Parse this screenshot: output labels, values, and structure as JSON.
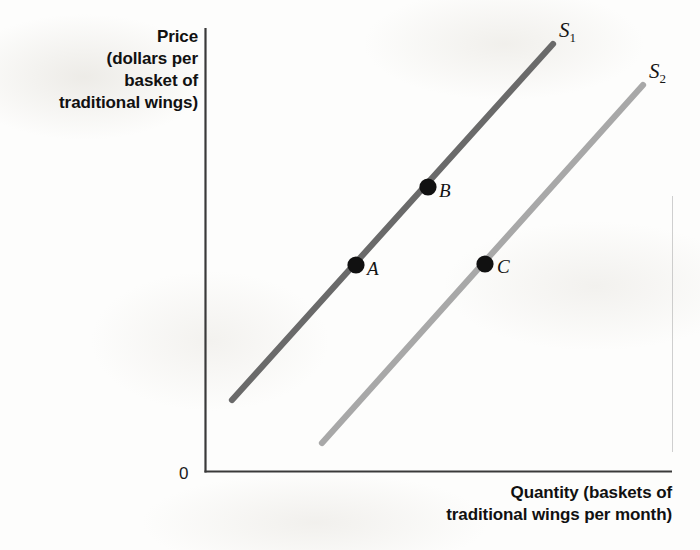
{
  "figure": {
    "origin_label": "0",
    "background_color": "#fdfdfc"
  },
  "axes": {
    "y_title": "Price (dollars per basket of traditional wings)",
    "y_title_lines": [
      "Price",
      "(dollars per",
      "basket of",
      "traditional wings)"
    ],
    "x_title": "Quantity (baskets of traditional wings per month)",
    "x_title_lines": [
      "Quantity (baskets of",
      "traditional wings per month)"
    ],
    "axis_color": "#3a3a3a"
  },
  "curves": [
    {
      "id": "S1",
      "label": "S",
      "subscript": "1",
      "color": "#6a6a6a",
      "x1": 232,
      "y1": 400,
      "x2": 553,
      "y2": 44
    },
    {
      "id": "S2",
      "label": "S",
      "subscript": "2",
      "color": "#a8a8a8",
      "x1": 322,
      "y1": 443,
      "x2": 643,
      "y2": 85
    }
  ],
  "points": [
    {
      "id": "A",
      "label": "A",
      "curve": "S1",
      "x": 356,
      "y": 265,
      "color": "#111111"
    },
    {
      "id": "B",
      "label": "B",
      "curve": "S1",
      "x": 428,
      "y": 187,
      "color": "#111111"
    },
    {
      "id": "C",
      "label": "C",
      "curve": "S2",
      "x": 485,
      "y": 264,
      "color": "#111111"
    }
  ],
  "chart_data": {
    "type": "line",
    "title": "",
    "xlabel": "Quantity (baskets of traditional wings per month)",
    "ylabel": "Price (dollars per basket of traditional wings)",
    "grid": false,
    "legend": "inline-curve-labels",
    "axis_ticks": {
      "x": [],
      "y": []
    },
    "origin_label": "0",
    "series": [
      {
        "name": "S1",
        "display_label": "S₁",
        "color": "#6a6a6a",
        "description": "Original upward-sloping supply curve",
        "points_px": [
          [
            232,
            400
          ],
          [
            553,
            44
          ]
        ],
        "slope_sign": "positive"
      },
      {
        "name": "S2",
        "display_label": "S₂",
        "color": "#a8a8a8",
        "description": "Supply curve shifted right (increase in supply), parallel to S1",
        "points_px": [
          [
            322,
            443
          ],
          [
            643,
            85
          ]
        ],
        "slope_sign": "positive"
      }
    ],
    "annotations": [
      {
        "label": "A",
        "on_series": "S1",
        "x_px": 356,
        "y_px": 265,
        "note": "Initial point on S1"
      },
      {
        "label": "B",
        "on_series": "S1",
        "x_px": 428,
        "y_px": 187,
        "note": "Higher price and quantity along S1"
      },
      {
        "label": "C",
        "on_series": "S2",
        "x_px": 485,
        "y_px": 264,
        "note": "Same price as A but larger quantity on S2"
      }
    ]
  }
}
